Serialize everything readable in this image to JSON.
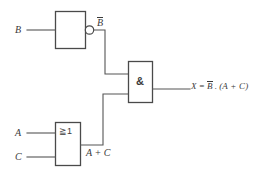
{
  "diagram": {
    "line_color": "#555555",
    "box_color": "#4a4a4a",
    "text_color": "#3a3a3a",
    "background": "#ffffff"
  },
  "inputs": {
    "b_label": "B",
    "a_label": "A",
    "c_label": "C"
  },
  "gates": {
    "inverter": {
      "symbol": "",
      "output_label_base": "B",
      "output_label_bar": true
    },
    "and_gate": {
      "symbol": "&"
    },
    "or_gate": {
      "symbol": "≧1"
    }
  },
  "labels": {
    "not_b": "B",
    "a_or_c": "A + C"
  },
  "output": {
    "expr_lhs": "X",
    "expr_eq": "=",
    "expr_negated_var": "B",
    "expr_dot": ".",
    "expr_group": "(A + C)"
  }
}
